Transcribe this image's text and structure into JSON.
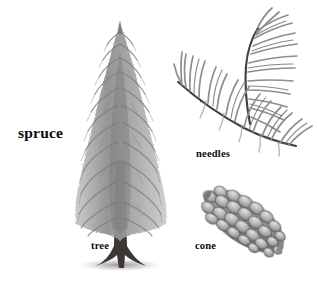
{
  "plate": {
    "title": "spruce",
    "background_color": "#ffffff",
    "ink_color": "#4a4a4a",
    "label_color": "#0d0d0d",
    "style": "grayscale pencil botanical illustration"
  },
  "labels": {
    "main": "spruce",
    "tree": "tree",
    "needles": "needles",
    "cone": "cone"
  },
  "figures": [
    {
      "id": "tree",
      "name": "spruce-tree-illustration",
      "label": "tree",
      "description": "full conical spruce tree with drooping branches and dark flared trunk base"
    },
    {
      "id": "needles",
      "name": "spruce-needles-illustration",
      "label": "needles",
      "description": "two curved twigs bearing radiating linear needles"
    },
    {
      "id": "cone",
      "name": "spruce-cone-illustration",
      "label": "cone",
      "description": "elongated pendent seed cone with overlapping scales tilted down-right"
    }
  ]
}
